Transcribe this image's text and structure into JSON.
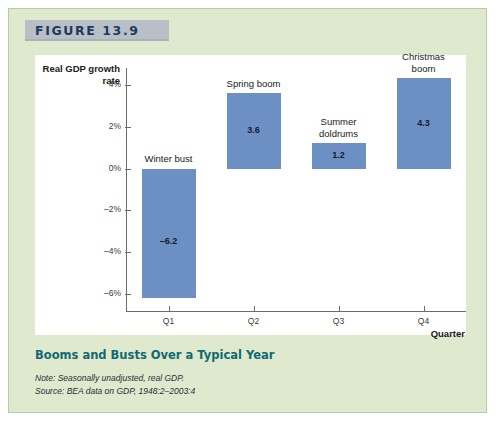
{
  "figure": {
    "number_label": "FIGURE 13.9",
    "caption_title": "Booms and Busts Over a Typical Year",
    "note": "Note: Seasonally unadjusted, real GDP.",
    "source": "Source: BEA data on GDP, 1948:2–2003:4",
    "panel_background": "#dfe9cd",
    "header_band_color": "#b8bfc6",
    "caption_color": "#0f6a75"
  },
  "chart_data": {
    "type": "bar",
    "title": "Booms and Busts Over a Typical Year",
    "xlabel": "Quarter",
    "ylabel": "Real GDP growth rate",
    "categories": [
      "Q1",
      "Q2",
      "Q3",
      "Q4"
    ],
    "values": [
      -6.2,
      3.6,
      1.2,
      4.3
    ],
    "value_labels": [
      "–6.2",
      "3.6",
      "1.2",
      "4.3"
    ],
    "annotations": [
      "Winter bust",
      "Spring boom",
      "Summer\ndoldrums",
      "Christmas\nboom"
    ],
    "ylim": [
      -6.8,
      4.8
    ],
    "yticks": [
      4,
      2,
      0,
      -2,
      -4,
      -6
    ],
    "ytick_labels": [
      "4%",
      "2%",
      "0%",
      "–2%",
      "–4%",
      "–6%"
    ],
    "grid": false,
    "legend": false,
    "bar_color": "#6d90c4",
    "axis_color": "#6c6c6c"
  }
}
